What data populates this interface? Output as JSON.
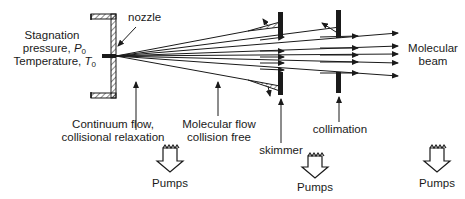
{
  "diagram": {
    "labels": {
      "stagnation_line1": "Stagnation",
      "stagnation_line2": "pressure,",
      "pressure_symbol": "P",
      "pressure_sub": "0",
      "temperature_text": "Temperature,",
      "temperature_symbol": "T",
      "temperature_sub": "0",
      "nozzle": "nozzle",
      "molecular_beam_line1": "Molecular",
      "molecular_beam_line2": "beam",
      "continuum_line1": "Continuum  flow,",
      "continuum_line2": "collisional  relaxation",
      "molecular_line1": "Molecular  flow",
      "molecular_line2": "collision  free",
      "skimmer": "skimmer",
      "collimation": "collimation",
      "pumps_1": "Pumps",
      "pumps_2": "Pumps",
      "pumps_3": "Pumps"
    },
    "colors": {
      "ink": "#1a1a1a",
      "background": "#ffffff"
    }
  }
}
